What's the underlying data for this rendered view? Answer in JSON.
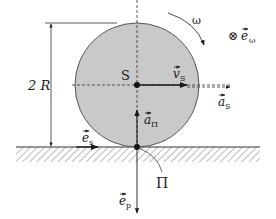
{
  "diagram": {
    "colors": {
      "disc_fill": "#c9c9c9",
      "disc_stroke": "#555555",
      "ink": "#1a1a1a",
      "hatch": "#777777",
      "background": "#ffffff"
    },
    "labels": {
      "dimension": "2 R",
      "center": "S",
      "omega": "ω",
      "e_omega_symbol": "⊗",
      "e_omega_base": "e",
      "e_omega_sub": "ω",
      "v_s_base": "v",
      "v_s_sub": "S",
      "a_s_base": "a",
      "a_s_sub": "S",
      "a_pi_base": "a",
      "a_pi_sub": "Π",
      "e_s_base": "e",
      "e_s_sub": "s",
      "e_p_base": "e",
      "e_p_sub": "p",
      "contact_point": "Π"
    },
    "geometry": {
      "center": [
        137,
        85
      ],
      "radius": 62,
      "ground_y": 147
    }
  }
}
